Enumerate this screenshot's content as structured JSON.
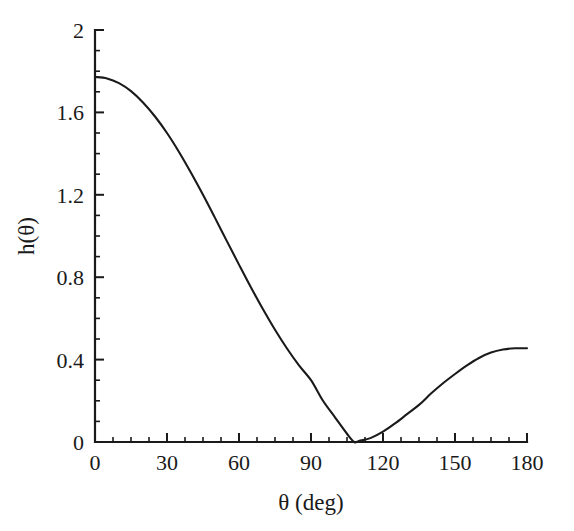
{
  "chart_data": {
    "type": "line",
    "title": "",
    "subtitle": "",
    "xlabel": "θ (deg)",
    "ylabel": "h(θ)",
    "xlim": [
      0,
      180
    ],
    "ylim": [
      0,
      2
    ],
    "grid": false,
    "legend": null,
    "x_ticks": [
      0,
      30,
      60,
      90,
      120,
      150,
      180
    ],
    "x_tick_labels": [
      "0",
      "30",
      "60",
      "90",
      "120",
      "150",
      "180"
    ],
    "x_minor_step": 7.5,
    "y_ticks": [
      0,
      0.4,
      0.8,
      1.2,
      1.6,
      2
    ],
    "y_tick_labels": [
      "0",
      "0.4",
      "0.8",
      "1.2",
      "1.6",
      "2"
    ],
    "y_minor_step": 0.1,
    "series": [
      {
        "name": "h(θ)",
        "color": "#1a1a1a",
        "x": [
          0,
          5,
          10,
          15,
          20,
          25,
          30,
          35,
          40,
          45,
          50,
          55,
          60,
          65,
          70,
          75,
          80,
          85,
          90,
          95,
          100,
          105,
          108,
          110,
          115,
          120,
          125,
          130,
          135,
          140,
          145,
          150,
          155,
          160,
          165,
          170,
          175,
          180
        ],
        "y": [
          1.772,
          1.765,
          1.742,
          1.703,
          1.648,
          1.58,
          1.5,
          1.408,
          1.307,
          1.2,
          1.088,
          0.974,
          0.861,
          0.75,
          0.644,
          0.545,
          0.454,
          0.372,
          0.3,
          0.2,
          0.12,
          0.04,
          0.0,
          0.005,
          0.02,
          0.05,
          0.09,
          0.135,
          0.18,
          0.235,
          0.285,
          0.33,
          0.372,
          0.408,
          0.434,
          0.449,
          0.455,
          0.455
        ]
      }
    ],
    "annotations": {
      "peak_value": 1.772,
      "peak_x": 0,
      "minimum_value": 0,
      "minimum_x": 108,
      "end_value": 0.455,
      "end_x": 180
    },
    "axis_color": "#1a1a1a",
    "background": "#ffffff"
  },
  "figure": {
    "background_color": "#ffffff"
  }
}
